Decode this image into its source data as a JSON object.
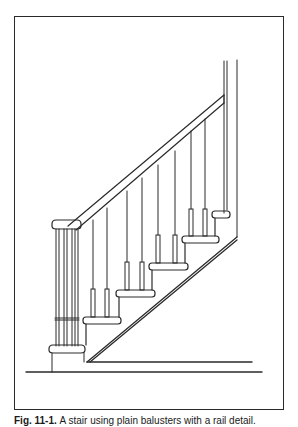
{
  "figure": {
    "number_label": "Fig. 11-1.",
    "caption_text": "A stair using plain balusters with a rail detail.",
    "colors": {
      "line": "#2a2a2a",
      "background": "#ffffff"
    },
    "elements": {
      "newel_post": "newel-post",
      "handrail": "handrail",
      "balusters_count": 9,
      "treads_count": 5,
      "wall_post": "wall-post",
      "stringer": "stringer",
      "floor": "floor-line"
    }
  }
}
